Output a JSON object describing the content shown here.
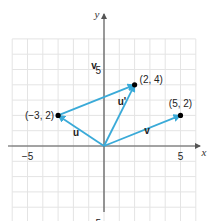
{
  "figure": {
    "axes": {
      "x_label": "x",
      "y_label": "y",
      "x_ticks": [
        {
          "value": -5,
          "label": "−5"
        },
        {
          "value": 5,
          "label": "5"
        }
      ],
      "y_ticks": [
        {
          "value": 5,
          "label": "5"
        },
        {
          "value": -5,
          "label": "−5"
        }
      ],
      "grid": true,
      "x_range": [
        -6,
        6
      ],
      "y_range": [
        -6,
        7
      ]
    },
    "points": [
      {
        "x": -3,
        "y": 2,
        "label": "(−3, 2)"
      },
      {
        "x": 2,
        "y": 4,
        "label": "(2, 4)"
      },
      {
        "x": 5,
        "y": 2,
        "label": "(5, 2)"
      }
    ],
    "vectors": [
      {
        "name": "u",
        "from": [
          0,
          0
        ],
        "to": [
          -3,
          2
        ],
        "label": "u"
      },
      {
        "name": "v",
        "from": [
          -3,
          2
        ],
        "to": [
          2,
          4
        ],
        "label": "v"
      },
      {
        "name": "u_prime",
        "from": [
          0,
          0
        ],
        "to": [
          2,
          4
        ],
        "label": "u'"
      },
      {
        "name": "v_origin",
        "from": [
          0,
          0
        ],
        "to": [
          5,
          2
        ],
        "label": "v"
      }
    ],
    "colors": {
      "vector": "#3aaad8",
      "grid": "#e4e4e4",
      "axis": "#555555",
      "point": "#000000"
    }
  }
}
